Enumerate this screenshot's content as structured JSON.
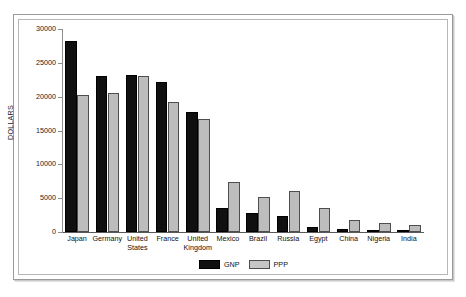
{
  "chart_data": {
    "type": "bar",
    "title": "",
    "subtitle": "",
    "xlabel": "",
    "ylabel": "DOLLARS",
    "ylim": [
      0,
      30000
    ],
    "ytick_labels": [
      "30000",
      "25000",
      "20000",
      "15000",
      "10000",
      "5000",
      "0"
    ],
    "ytick_values": [
      30000,
      25000,
      20000,
      15000,
      10000,
      5000,
      0
    ],
    "grid": false,
    "legend_position": "bottom-center",
    "categories": [
      "Japan",
      "Germany",
      "United\nStates",
      "France",
      "United\nKingdom",
      "Mexico",
      "Brazil",
      "Russia",
      "Egypt",
      "China",
      "Nigeria",
      "India"
    ],
    "series": [
      {
        "name": "GNP",
        "color": "#101010",
        "values": [
          28200,
          23000,
          23200,
          22200,
          17700,
          3500,
          2800,
          2400,
          700,
          500,
          250,
          250
        ]
      },
      {
        "name": "PPP",
        "color": "#bdbdbd",
        "values": [
          20200,
          20600,
          23100,
          19200,
          16700,
          7400,
          5100,
          6100,
          3600,
          1800,
          1300,
          1050
        ]
      }
    ]
  }
}
